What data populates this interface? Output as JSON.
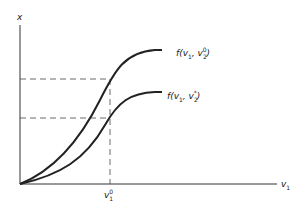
{
  "axes": {
    "y_label": "x",
    "x_label_base": "v",
    "x_label_sub": "1"
  },
  "tick": {
    "base": "v",
    "sub": "1",
    "sup": "0"
  },
  "curves": [
    {
      "name": "upper",
      "label_prefix": "f(v",
      "label_sub1": "1",
      "label_mid": ", v",
      "label_sub2": "2",
      "label_sup": "0",
      "label_suffix": ")"
    },
    {
      "name": "lower",
      "label_prefix": "f(v",
      "label_sub1": "1",
      "label_mid": ", v",
      "label_sub2": "2",
      "label_sup": "*",
      "label_suffix": ")"
    }
  ],
  "colors": {
    "ink": "#222222",
    "dash": "#444444"
  }
}
